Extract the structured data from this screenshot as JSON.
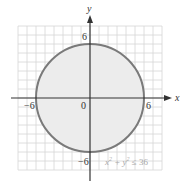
{
  "chart_data": {
    "type": "area",
    "title": "",
    "xlabel": "x",
    "ylabel": "y",
    "xlim": [
      -8,
      8
    ],
    "ylim": [
      -8,
      8
    ],
    "grid": true,
    "tick_labels": {
      "x": [
        "-6",
        "0",
        "6"
      ],
      "y": [
        "6",
        "-6"
      ]
    },
    "series": [
      {
        "name": "circle",
        "shape": "circle",
        "center": [
          0,
          0
        ],
        "radius": 6,
        "filled": true,
        "inequality": "x² + y² ≤ 36"
      }
    ],
    "annotations": [
      "x² + y² ≤ 36"
    ],
    "colors": {
      "grid": "#d6d6d6",
      "circle_stroke": "#7a7a7a",
      "circle_fill": "#ececec",
      "axis": "#333333",
      "annotation": "#b0b0b0"
    }
  },
  "labels": {
    "x_axis": "x",
    "y_axis": "y",
    "x_neg6": "−6",
    "x_pos6": "6",
    "origin": "0",
    "y_pos6": "6",
    "y_neg6": "−6",
    "inequality_lhs": "x",
    "inequality_mid": " + y",
    "inequality_rhs": " ≤ 36",
    "sup": "2"
  }
}
